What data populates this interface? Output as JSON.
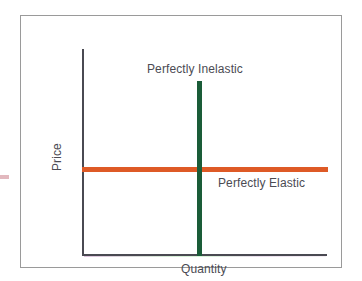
{
  "chart_data": {
    "type": "line",
    "title": "",
    "xlabel": "Quantity",
    "ylabel": "Price",
    "grid": false,
    "legend_position": "inline-annotations",
    "axis_ranges": {
      "x": [
        0,
        100
      ],
      "y": [
        0,
        100
      ]
    },
    "series": [
      {
        "name": "Perfectly Inelastic",
        "orientation": "vertical",
        "color": "#1a5c38",
        "x_value": 47,
        "y_from": 0,
        "y_to": 85,
        "annotation": "Perfectly Inelastic",
        "annotation_position": "top"
      },
      {
        "name": "Perfectly Elastic",
        "orientation": "horizontal",
        "color": "#de5a26",
        "y_value": 42,
        "x_from": 0,
        "x_to": 100,
        "annotation": "Perfectly Elastic",
        "annotation_position": "right-below"
      }
    ],
    "annotations": [
      {
        "text": "Perfectly Inelastic",
        "refers_to": "Perfectly Inelastic"
      },
      {
        "text": "Perfectly Elastic",
        "refers_to": "Perfectly Elastic"
      }
    ]
  },
  "figure": {
    "axis_label_y": "Price",
    "axis_label_x": "Quantity",
    "annotation_inelastic": "Perfectly Inelastic",
    "annotation_elastic": "Perfectly Elastic",
    "colors": {
      "inelastic_line": "#1a5c38",
      "elastic_line": "#de5a26",
      "axis": "#4a4a52",
      "frame": "#9a9a9a",
      "text": "#4b4b53",
      "background": "#ffffff"
    }
  }
}
